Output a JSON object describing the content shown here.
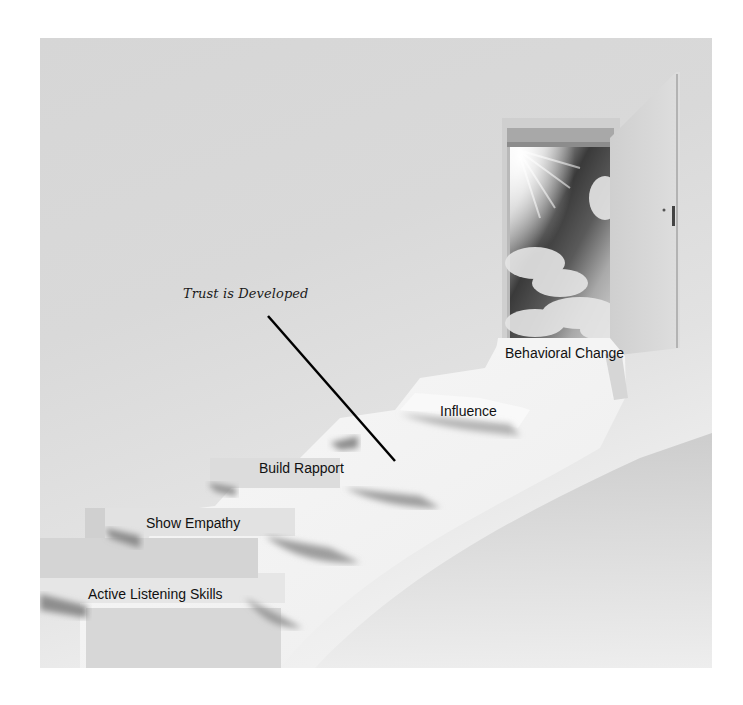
{
  "diagram": {
    "annotation": {
      "text": "Trust is Developed",
      "pointer_from": [
        268,
        316
      ],
      "pointer_to": [
        395,
        461
      ]
    },
    "steps": [
      {
        "order": 1,
        "label": "Active Listening Skills"
      },
      {
        "order": 2,
        "label": "Show Empathy"
      },
      {
        "order": 3,
        "label": "Build Rapport"
      },
      {
        "order": 4,
        "label": "Influence"
      },
      {
        "order": 5,
        "label": "Behavioral Change"
      }
    ],
    "elements": {
      "doorway": "open-door",
      "sky": "sky-with-sun-and-clouds",
      "door_leaf": "door-leaf-open"
    },
    "colors": {
      "wall": "#d9d9d9",
      "step_face": "#e4e4e4",
      "step_lit": "#f7f7f7",
      "shadow": "#9a9a9a",
      "text": "#111111",
      "pointer_line": "#000000"
    }
  }
}
